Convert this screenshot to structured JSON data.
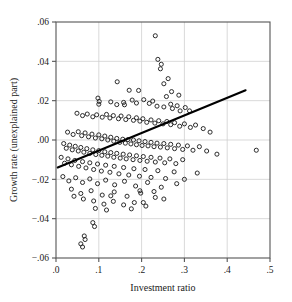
{
  "chart_data": {
    "type": "scatter",
    "title": "",
    "xlabel": "Investment ratio",
    "ylabel": "Growth rate (unexplained part)",
    "xlim": [
      0.0,
      0.5
    ],
    "ylim": [
      -0.06,
      0.06
    ],
    "xticks": [
      0.0,
      0.1,
      0.2,
      0.3,
      0.4,
      0.5
    ],
    "xticklabels": [
      ".0",
      ".1",
      ".2",
      ".3",
      ".4",
      ".5"
    ],
    "yticks": [
      -0.06,
      -0.04,
      -0.02,
      0.0,
      0.02,
      0.04,
      0.06
    ],
    "yticklabels": [
      "−.06",
      "−.04",
      "−.02",
      ".00",
      ".02",
      ".04",
      ".06"
    ],
    "grid": true,
    "grid_color": "#cfcfcf",
    "frame_color": "#555555",
    "marker": "open-circle",
    "marker_color": "#222222",
    "marker_size": 4.1,
    "fit_line": {
      "label": "regression line",
      "color": "#000000",
      "width": 2.1,
      "x0": 0.004,
      "y0": -0.014,
      "x1": 0.443,
      "y1": 0.0253,
      "slope": 0.0896,
      "intercept": -0.01436
    },
    "n_points": 204,
    "points": [
      [
        0.232,
        0.053
      ],
      [
        0.238,
        0.041
      ],
      [
        0.246,
        0.0385
      ],
      [
        0.244,
        0.0362
      ],
      [
        0.143,
        0.0296
      ],
      [
        0.262,
        0.0312
      ],
      [
        0.252,
        0.0286
      ],
      [
        0.171,
        0.0253
      ],
      [
        0.193,
        0.0252
      ],
      [
        0.27,
        0.0246
      ],
      [
        0.287,
        0.0228
      ],
      [
        0.258,
        0.0221
      ],
      [
        0.098,
        0.0213
      ],
      [
        0.101,
        0.0196
      ],
      [
        0.1,
        0.0182
      ],
      [
        0.128,
        0.0194
      ],
      [
        0.142,
        0.018
      ],
      [
        0.158,
        0.0191
      ],
      [
        0.16,
        0.0179
      ],
      [
        0.178,
        0.0203
      ],
      [
        0.188,
        0.0188
      ],
      [
        0.205,
        0.0205
      ],
      [
        0.218,
        0.0186
      ],
      [
        0.226,
        0.0198
      ],
      [
        0.236,
        0.0172
      ],
      [
        0.252,
        0.0168
      ],
      [
        0.268,
        0.0182
      ],
      [
        0.272,
        0.016
      ],
      [
        0.283,
        0.0174
      ],
      [
        0.29,
        0.0148
      ],
      [
        0.302,
        0.0165
      ],
      [
        0.312,
        0.0148
      ],
      [
        0.049,
        0.0136
      ],
      [
        0.062,
        0.0124
      ],
      [
        0.073,
        0.0132
      ],
      [
        0.086,
        0.0118
      ],
      [
        0.095,
        0.0128
      ],
      [
        0.108,
        0.0116
      ],
      [
        0.118,
        0.013
      ],
      [
        0.126,
        0.0112
      ],
      [
        0.134,
        0.0124
      ],
      [
        0.146,
        0.0108
      ],
      [
        0.152,
        0.0122
      ],
      [
        0.163,
        0.0104
      ],
      [
        0.17,
        0.0118
      ],
      [
        0.181,
        0.01
      ],
      [
        0.188,
        0.0113
      ],
      [
        0.196,
        0.0096
      ],
      [
        0.203,
        0.0108
      ],
      [
        0.212,
        0.009
      ],
      [
        0.222,
        0.0102
      ],
      [
        0.231,
        0.0086
      ],
      [
        0.24,
        0.0098
      ],
      [
        0.25,
        0.0082
      ],
      [
        0.259,
        0.0094
      ],
      [
        0.268,
        0.0078
      ],
      [
        0.277,
        0.0088
      ],
      [
        0.289,
        0.007
      ],
      [
        0.3,
        0.0082
      ],
      [
        0.314,
        0.0064
      ],
      [
        0.326,
        0.0076
      ],
      [
        0.344,
        0.0058
      ],
      [
        0.36,
        0.004
      ],
      [
        0.027,
        0.004
      ],
      [
        0.04,
        0.0028
      ],
      [
        0.052,
        0.0042
      ],
      [
        0.06,
        0.0022
      ],
      [
        0.068,
        0.0036
      ],
      [
        0.076,
        0.0016
      ],
      [
        0.084,
        0.003
      ],
      [
        0.092,
        0.001
      ],
      [
        0.1,
        0.0026
      ],
      [
        0.107,
        0.0006
      ],
      [
        0.114,
        0.002
      ],
      [
        0.121,
        0.0
      ],
      [
        0.128,
        0.0014
      ],
      [
        0.135,
        -0.0006
      ],
      [
        0.142,
        0.0008
      ],
      [
        0.149,
        -0.0012
      ],
      [
        0.156,
        0.0004
      ],
      [
        0.162,
        -0.0016
      ],
      [
        0.168,
        0.0002
      ],
      [
        0.175,
        -0.002
      ],
      [
        0.181,
        0.0
      ],
      [
        0.188,
        -0.0024
      ],
      [
        0.194,
        -0.0004
      ],
      [
        0.201,
        -0.0028
      ],
      [
        0.208,
        -0.0008
      ],
      [
        0.215,
        -0.003
      ],
      [
        0.222,
        -0.0012
      ],
      [
        0.229,
        -0.0034
      ],
      [
        0.236,
        -0.0016
      ],
      [
        0.244,
        -0.0036
      ],
      [
        0.252,
        -0.0018
      ],
      [
        0.26,
        -0.004
      ],
      [
        0.268,
        -0.0022
      ],
      [
        0.277,
        -0.0044
      ],
      [
        0.286,
        -0.0026
      ],
      [
        0.296,
        -0.0048
      ],
      [
        0.307,
        -0.003
      ],
      [
        0.32,
        -0.0052
      ],
      [
        0.335,
        -0.0034
      ],
      [
        0.352,
        -0.0056
      ],
      [
        0.468,
        -0.0052
      ],
      [
        0.376,
        -0.0072
      ],
      [
        0.018,
        -0.0018
      ],
      [
        0.024,
        -0.0042
      ],
      [
        0.032,
        -0.0026
      ],
      [
        0.038,
        -0.005
      ],
      [
        0.045,
        -0.0032
      ],
      [
        0.052,
        -0.0056
      ],
      [
        0.058,
        -0.0038
      ],
      [
        0.065,
        -0.0062
      ],
      [
        0.072,
        -0.0044
      ],
      [
        0.079,
        -0.0068
      ],
      [
        0.086,
        -0.005
      ],
      [
        0.093,
        -0.0074
      ],
      [
        0.1,
        -0.0054
      ],
      [
        0.107,
        -0.0078
      ],
      [
        0.114,
        -0.006
      ],
      [
        0.121,
        -0.0082
      ],
      [
        0.128,
        -0.0064
      ],
      [
        0.135,
        -0.0088
      ],
      [
        0.142,
        -0.0068
      ],
      [
        0.15,
        -0.0092
      ],
      [
        0.157,
        -0.0072
      ],
      [
        0.164,
        -0.0096
      ],
      [
        0.172,
        -0.0076
      ],
      [
        0.18,
        -0.01
      ],
      [
        0.188,
        -0.008
      ],
      [
        0.196,
        -0.0104
      ],
      [
        0.204,
        -0.0084
      ],
      [
        0.213,
        -0.0108
      ],
      [
        0.222,
        -0.0088
      ],
      [
        0.232,
        -0.0112
      ],
      [
        0.243,
        -0.0092
      ],
      [
        0.254,
        -0.0116
      ],
      [
        0.266,
        -0.0096
      ],
      [
        0.28,
        -0.012
      ],
      [
        0.296,
        -0.01
      ],
      [
        0.012,
        -0.0088
      ],
      [
        0.02,
        -0.0118
      ],
      [
        0.028,
        -0.0096
      ],
      [
        0.036,
        -0.0126
      ],
      [
        0.044,
        -0.0104
      ],
      [
        0.053,
        -0.0134
      ],
      [
        0.062,
        -0.011
      ],
      [
        0.07,
        -0.0142
      ],
      [
        0.079,
        -0.0116
      ],
      [
        0.088,
        -0.015
      ],
      [
        0.097,
        -0.0122
      ],
      [
        0.106,
        -0.0158
      ],
      [
        0.116,
        -0.0128
      ],
      [
        0.126,
        -0.0164
      ],
      [
        0.136,
        -0.0134
      ],
      [
        0.147,
        -0.0172
      ],
      [
        0.158,
        -0.014
      ],
      [
        0.17,
        -0.0178
      ],
      [
        0.182,
        -0.0146
      ],
      [
        0.195,
        -0.0184
      ],
      [
        0.208,
        -0.015
      ],
      [
        0.222,
        -0.019
      ],
      [
        0.238,
        -0.0156
      ],
      [
        0.256,
        -0.0196
      ],
      [
        0.276,
        -0.0162
      ],
      [
        0.3,
        -0.02
      ],
      [
        0.33,
        -0.0168
      ],
      [
        0.016,
        -0.0186
      ],
      [
        0.03,
        -0.0208
      ],
      [
        0.046,
        -0.0192
      ],
      [
        0.062,
        -0.0216
      ],
      [
        0.079,
        -0.0198
      ],
      [
        0.097,
        -0.0222
      ],
      [
        0.116,
        -0.0204
      ],
      [
        0.137,
        -0.0228
      ],
      [
        0.16,
        -0.021
      ],
      [
        0.186,
        -0.0234
      ],
      [
        0.214,
        -0.0216
      ],
      [
        0.246,
        -0.024
      ],
      [
        0.282,
        -0.0222
      ],
      [
        0.196,
        -0.0258
      ],
      [
        0.229,
        -0.0262
      ],
      [
        0.036,
        -0.025
      ],
      [
        0.058,
        -0.0272
      ],
      [
        0.082,
        -0.0258
      ],
      [
        0.108,
        -0.028
      ],
      [
        0.136,
        -0.0264
      ],
      [
        0.166,
        -0.0286
      ],
      [
        0.198,
        -0.027
      ],
      [
        0.232,
        -0.0292
      ],
      [
        0.088,
        -0.031
      ],
      [
        0.112,
        -0.0326
      ],
      [
        0.134,
        -0.0312
      ],
      [
        0.158,
        -0.033
      ],
      [
        0.183,
        -0.0318
      ],
      [
        0.21,
        -0.0336
      ],
      [
        0.092,
        -0.0348
      ],
      [
        0.118,
        -0.0356
      ],
      [
        0.064,
        -0.03
      ],
      [
        0.042,
        -0.0286
      ],
      [
        0.086,
        -0.042
      ],
      [
        0.09,
        -0.044
      ],
      [
        0.066,
        -0.0488
      ],
      [
        0.068,
        -0.0506
      ],
      [
        0.058,
        -0.0528
      ],
      [
        0.062,
        -0.0544
      ],
      [
        0.128,
        -0.0284
      ],
      [
        0.252,
        -0.03
      ],
      [
        0.176,
        -0.035
      ],
      [
        0.204,
        -0.0318
      ]
    ]
  }
}
